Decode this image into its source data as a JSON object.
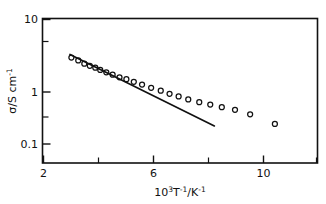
{
  "chart_data": {
    "type": "scatter",
    "title": "",
    "subtitle": "",
    "xlabel": "10^3 T^-1 / K^-1",
    "xlabel_parts": {
      "base": "10",
      "base_exp": "3",
      "var": "T",
      "var_exp": "-1",
      "slash": "/",
      "unit": "K",
      "unit_exp": "-1"
    },
    "ylabel": "sigma / S cm^-1",
    "ylabel_parts": {
      "symbol": "σ",
      "slash": "/S",
      "unit": "cm",
      "unit_exp": "-1"
    },
    "xscale": "linear",
    "yscale": "log",
    "xlim": [
      2,
      12
    ],
    "ylim": [
      0.063,
      10
    ],
    "grid": false,
    "legend": null,
    "x_major_ticks": [
      2,
      6,
      10
    ],
    "x_major_tick_labels": [
      "2",
      "6",
      "10"
    ],
    "x_minor_ticks": [
      4,
      8,
      12
    ],
    "y_major_ticks": [
      10,
      1,
      0.1
    ],
    "y_major_tick_labels": [
      "10",
      "1",
      "0.1"
    ],
    "y_minor_ticks": [
      5,
      0.5
    ],
    "series": [
      {
        "name": "conductivity-data",
        "marker": "open-circle",
        "x": [
          3.05,
          3.3,
          3.52,
          3.72,
          3.92,
          4.1,
          4.32,
          4.55,
          4.8,
          5.05,
          5.32,
          5.62,
          5.95,
          6.3,
          6.62,
          6.95,
          7.3,
          7.7,
          8.1,
          8.52,
          9.0,
          9.55,
          10.45
        ],
        "y": [
          2.45,
          2.2,
          1.95,
          1.8,
          1.68,
          1.55,
          1.42,
          1.3,
          1.18,
          1.1,
          1.0,
          0.9,
          0.8,
          0.72,
          0.64,
          0.58,
          0.52,
          0.47,
          0.43,
          0.39,
          0.355,
          0.3,
          0.21
        ]
      }
    ],
    "annotations": [
      {
        "name": "arrhenius-fit-line",
        "type": "line",
        "x0": 3.0,
        "y0": 2.75,
        "x1": 8.25,
        "y1": 0.195
      }
    ]
  }
}
